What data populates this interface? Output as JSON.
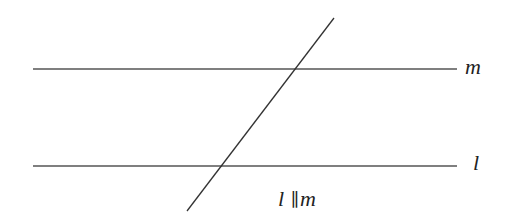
{
  "diagram": {
    "type": "parallel-lines-with-transversal",
    "lines": [
      {
        "name": "m",
        "label": "m",
        "y": 69,
        "x1": 33,
        "x2": 457
      },
      {
        "name": "l",
        "label": "l",
        "y": 166,
        "x1": 33,
        "x2": 457
      }
    ],
    "transversal": {
      "x1": 334,
      "y1": 18,
      "x2": 187,
      "y2": 211
    },
    "caption": "l ∥ m",
    "caption_parts": {
      "left": "l",
      "symbol": "∥",
      "right": "m"
    },
    "line_color": "#555555"
  }
}
